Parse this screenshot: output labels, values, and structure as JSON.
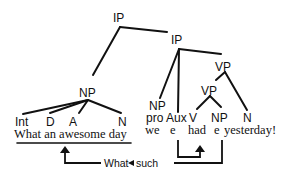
{
  "diagram": {
    "title": "",
    "nodes": {
      "ip_top": "IP",
      "ip_inner": "IP",
      "np_subject": "NP",
      "vp_outer": "VP",
      "vp_inner": "VP",
      "np_pro": "NP"
    },
    "categories": {
      "int": "Int",
      "d": "D",
      "a": "A",
      "n1": "N",
      "pro": "pro",
      "aux": "Aux",
      "v": "V",
      "np_obj": "NP",
      "n2": "N"
    },
    "words": {
      "phrase": "What an awesome day",
      "we": "we",
      "e_aux": "e",
      "had": "had",
      "e_obj": "e",
      "yesterday": "yesterday!"
    },
    "movement": {
      "label_what": "What",
      "label_such": "such"
    }
  }
}
